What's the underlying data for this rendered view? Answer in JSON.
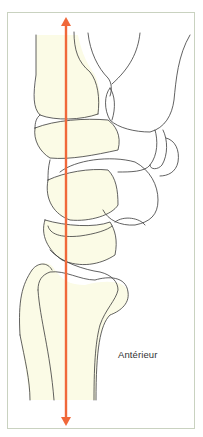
{
  "figure": {
    "type": "anatomical-line-drawing",
    "label": "Antérieur",
    "colors": {
      "axis_arrow": "#f0683a",
      "bone_fill": "#fbfbe6",
      "outline": "#3a3a3a",
      "frame_border": "#c9d2c0"
    }
  }
}
